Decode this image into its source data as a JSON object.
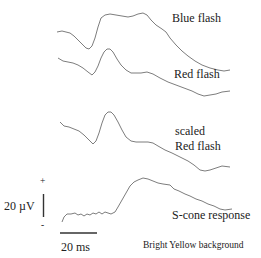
{
  "chart_data": {
    "type": "line",
    "title": "",
    "xlabel": "",
    "ylabel": "",
    "grid": false,
    "legend": "inline labels",
    "annotation": "Bright Yellow background",
    "scale_bars": {
      "voltage": {
        "label": "20 µV",
        "plus": "+",
        "minus": "-"
      },
      "time": {
        "label": "20 ms"
      }
    },
    "series": [
      {
        "name": "Blue flash",
        "label_lines": [
          "Blue flash"
        ],
        "points": [
          [
            57,
            32
          ],
          [
            62,
            31
          ],
          [
            66,
            32
          ],
          [
            70,
            33
          ],
          [
            74,
            36
          ],
          [
            78,
            40
          ],
          [
            82,
            44
          ],
          [
            86,
            48
          ],
          [
            89,
            49
          ],
          [
            92,
            46
          ],
          [
            95,
            38
          ],
          [
            98,
            27
          ],
          [
            101,
            18
          ],
          [
            105,
            15
          ],
          [
            110,
            14
          ],
          [
            116,
            15
          ],
          [
            122,
            16
          ],
          [
            128,
            17
          ],
          [
            133,
            16
          ],
          [
            138,
            14
          ],
          [
            143,
            13
          ],
          [
            147,
            15
          ],
          [
            151,
            20
          ],
          [
            156,
            25
          ],
          [
            162,
            29
          ],
          [
            166,
            32
          ],
          [
            170,
            38
          ],
          [
            176,
            45
          ],
          [
            182,
            51
          ],
          [
            188,
            56
          ],
          [
            195,
            61
          ],
          [
            202,
            65
          ],
          [
            210,
            68
          ],
          [
            218,
            70
          ],
          [
            224,
            71
          ],
          [
            230,
            70
          ]
        ]
      },
      {
        "name": "Red flash",
        "label_lines": [
          "Red flash"
        ],
        "points": [
          [
            58,
            58
          ],
          [
            63,
            61
          ],
          [
            68,
            62
          ],
          [
            73,
            63
          ],
          [
            78,
            65
          ],
          [
            83,
            68
          ],
          [
            88,
            72
          ],
          [
            92,
            75
          ],
          [
            95,
            72
          ],
          [
            98,
            66
          ],
          [
            101,
            58
          ],
          [
            104,
            52
          ],
          [
            107,
            49
          ],
          [
            110,
            49
          ],
          [
            113,
            52
          ],
          [
            117,
            59
          ],
          [
            121,
            65
          ],
          [
            126,
            70
          ],
          [
            131,
            73
          ],
          [
            136,
            73
          ],
          [
            141,
            73
          ],
          [
            147,
            72
          ],
          [
            153,
            74
          ],
          [
            160,
            78
          ],
          [
            168,
            82
          ],
          [
            176,
            85
          ],
          [
            184,
            88
          ],
          [
            192,
            91
          ],
          [
            198,
            94
          ],
          [
            204,
            96
          ],
          [
            210,
            95
          ],
          [
            216,
            94
          ],
          [
            222,
            92
          ],
          [
            230,
            91
          ]
        ]
      },
      {
        "name": "scaled Red flash",
        "label_lines": [
          "scaled",
          "Red flash"
        ],
        "points": [
          [
            60,
            122
          ],
          [
            64,
            126
          ],
          [
            69,
            127
          ],
          [
            74,
            129
          ],
          [
            79,
            131
          ],
          [
            84,
            135
          ],
          [
            89,
            140
          ],
          [
            93,
            144
          ],
          [
            96,
            141
          ],
          [
            99,
            133
          ],
          [
            102,
            123
          ],
          [
            105,
            115
          ],
          [
            108,
            112
          ],
          [
            111,
            112
          ],
          [
            114,
            115
          ],
          [
            118,
            122
          ],
          [
            122,
            130
          ],
          [
            126,
            137
          ],
          [
            131,
            141
          ],
          [
            136,
            142
          ],
          [
            142,
            142
          ],
          [
            148,
            142
          ],
          [
            153,
            143
          ],
          [
            158,
            146
          ],
          [
            165,
            150
          ],
          [
            172,
            153
          ],
          [
            180,
            157
          ],
          [
            188,
            161
          ],
          [
            194,
            165
          ],
          [
            200,
            170
          ],
          [
            205,
            171
          ],
          [
            210,
            170
          ],
          [
            216,
            168
          ],
          [
            222,
            166
          ],
          [
            230,
            167
          ]
        ]
      },
      {
        "name": "S-cone response",
        "label_lines": [
          "S-cone response"
        ],
        "points": [
          [
            62,
            222
          ],
          [
            64,
            217
          ],
          [
            67,
            214
          ],
          [
            71,
            214
          ],
          [
            75,
            213
          ],
          [
            78,
            215
          ],
          [
            81,
            214
          ],
          [
            84,
            216
          ],
          [
            87,
            214
          ],
          [
            90,
            215
          ],
          [
            93,
            213
          ],
          [
            96,
            214
          ],
          [
            99,
            212
          ],
          [
            102,
            214
          ],
          [
            105,
            212
          ],
          [
            108,
            213
          ],
          [
            111,
            214
          ],
          [
            115,
            212
          ],
          [
            118,
            207
          ],
          [
            122,
            200
          ],
          [
            126,
            193
          ],
          [
            130,
            186
          ],
          [
            134,
            182
          ],
          [
            138,
            180
          ],
          [
            143,
            178
          ],
          [
            148,
            179
          ],
          [
            153,
            181
          ],
          [
            158,
            183
          ],
          [
            163,
            184
          ],
          [
            170,
            185
          ],
          [
            174,
            189
          ],
          [
            179,
            191
          ],
          [
            185,
            194
          ],
          [
            190,
            196
          ],
          [
            196,
            199
          ],
          [
            202,
            201
          ],
          [
            208,
            204
          ],
          [
            214,
            206
          ],
          [
            220,
            209
          ],
          [
            225,
            210
          ],
          [
            232,
            209
          ]
        ]
      }
    ]
  }
}
